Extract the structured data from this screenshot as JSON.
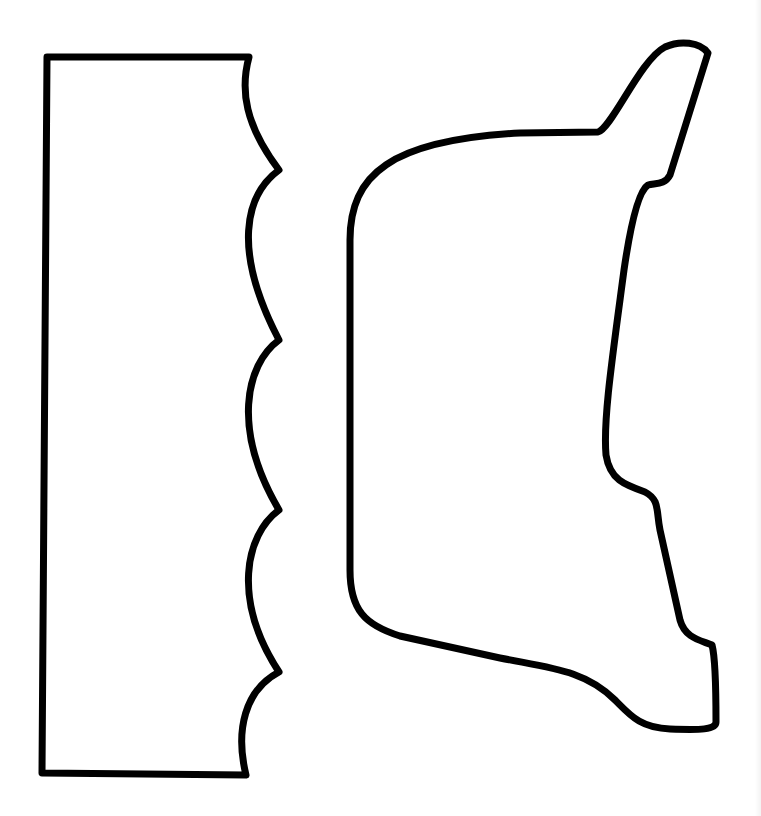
{
  "canvas": {
    "width": 761,
    "height": 816,
    "background": "#ffffff"
  },
  "stroke": {
    "color": "#000000",
    "width": 7
  },
  "shapes": [
    {
      "name": "scalloped-rectangle-piece",
      "path": "M 47 57 L 249 57 C 240 90, 245 125, 279 170 C 245 195, 232 250, 279 340 C 245 365, 232 430, 279 510 C 245 535, 232 600, 279 672 C 245 690, 235 730, 246 775 L 42 773 Z"
    },
    {
      "name": "curved-tab-piece",
      "path": "M 350 240 C 350 175, 390 140, 520 133 L 598 132 C 612 128, 640 60, 665 47 C 680 40, 700 42, 708 53 L 670 175 C 665 185, 655 183, 648 185 C 640 190, 632 215, 624 270 C 612 360, 603 420, 606 455 C 610 480, 625 485, 645 492 C 660 500, 656 510, 660 530 L 680 620 C 685 638, 700 640, 712 645 C 716 660, 716 700, 716 722 C 716 730, 700 730, 670 729 C 640 728, 630 715, 615 700 C 585 670, 550 668, 500 658 L 400 636 C 365 625, 350 610, 350 570 Z"
    }
  ]
}
